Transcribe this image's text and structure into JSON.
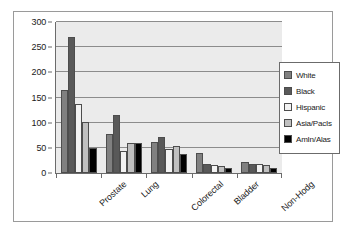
{
  "chart_data": {
    "type": "bar",
    "title": "",
    "subtitle": "",
    "xlabel": "",
    "ylabel": "",
    "categories": [
      "Prostate",
      "Lung",
      "Colorectal",
      "Bladder",
      "Non-Hodg"
    ],
    "series": [
      {
        "name": "White",
        "color": "#808080",
        "values": [
          165,
          77,
          61,
          39,
          22
        ]
      },
      {
        "name": "Black",
        "color": "#595959",
        "values": [
          270,
          116,
          71,
          18,
          17
        ]
      },
      {
        "name": "Hispanic",
        "color": "#f2f2f2",
        "values": [
          138,
          44,
          48,
          16,
          17
        ]
      },
      {
        "name": "Asia/PacIs",
        "color": "#c0c0c0",
        "values": [
          101,
          59,
          54,
          14,
          15
        ]
      },
      {
        "name": "AmIn/Alas",
        "color": "#000000",
        "values": [
          50,
          59,
          37,
          9,
          9
        ]
      }
    ],
    "ylim": [
      0,
      300
    ],
    "yticks": [
      0,
      50,
      100,
      150,
      200,
      250,
      300
    ],
    "ytick_labels": [
      "0",
      "50",
      "100",
      "150",
      "200",
      "250",
      "300"
    ],
    "grid": true,
    "legend_position": "right",
    "plot_background": "#ebebeb",
    "frame_border": "#9a9a9a"
  }
}
